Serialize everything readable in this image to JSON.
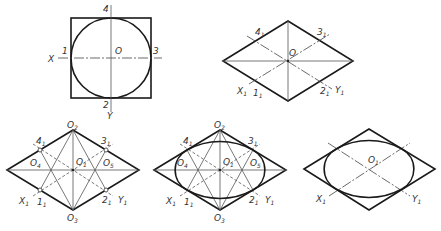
{
  "diagram": {
    "colors": {
      "outline": "#1a1a1a",
      "construction": "#555555",
      "label": "#333333",
      "background": "#ffffff"
    },
    "panels": [
      {
        "id": "a",
        "description": "Circle inscribed in square with axes",
        "labels": {
          "top": "4",
          "left_axis": "X",
          "left": "1",
          "center": "O",
          "right": "3",
          "bottom": "2",
          "bottom_axis": "Y"
        }
      },
      {
        "id": "b",
        "description": "Isometric rhombus with axes and tangent points",
        "labels": {
          "p4": "4",
          "p3": "3",
          "center": "O",
          "x_axis": "X",
          "p1": "1",
          "p2": "2",
          "y_axis": "Y",
          "sub": "1"
        }
      },
      {
        "id": "c",
        "description": "Locating four arc centres",
        "labels": {
          "o2": "O",
          "o2_sub": "2",
          "p4": "4",
          "p3": "3",
          "o4": "O",
          "o4_sub": "4",
          "o1": "O",
          "o1_sub": "1",
          "o5": "O",
          "o5_sub": "5",
          "x_axis": "X",
          "p1": "1",
          "p2": "2",
          "y_axis": "Y",
          "o3": "O",
          "o3_sub": "3",
          "sub": "1"
        }
      },
      {
        "id": "d",
        "description": "Drawing the four arcs",
        "labels": {
          "o2": "O",
          "o2_sub": "2",
          "p4": "4",
          "p3": "3",
          "o4": "O",
          "o4_sub": "4",
          "o1": "O",
          "o1_sub": "1",
          "o5": "O",
          "o5_sub": "5",
          "x_axis": "X",
          "p1": "1",
          "p2": "2",
          "y_axis": "Y",
          "o3": "O",
          "o3_sub": "3",
          "sub": "1"
        }
      },
      {
        "id": "e",
        "description": "Finished approximate ellipse",
        "labels": {
          "o1": "O",
          "o1_sub": "1",
          "x_axis": "X",
          "y_axis": "Y",
          "sub": "1"
        }
      }
    ]
  }
}
